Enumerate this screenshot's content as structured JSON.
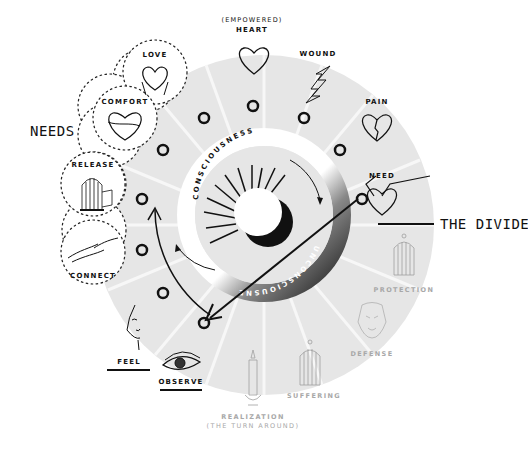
{
  "diagram": {
    "needs_label": "NEEDS",
    "divide_label": "THE DIVIDE",
    "ring": {
      "upper": "CONSCIOUSNESS",
      "lower": "UNCONSCIOUSNESS"
    },
    "needs_circles": [
      {
        "label": "LOVE",
        "icon": "hands-holding-heart-icon"
      },
      {
        "label": "COMFORT",
        "icon": "hug-heart-icon"
      },
      {
        "label": "RELEASE",
        "icon": "open-birdcage-icon"
      },
      {
        "label": "CONNECT",
        "icon": "touching-hands-icon"
      }
    ],
    "stages": [
      {
        "label": "HEART",
        "sublabel": "(EMPOWERED)",
        "icon": "heart-icon"
      },
      {
        "label": "WOUND",
        "icon": "lightning-bolt-icon"
      },
      {
        "label": "PAIN",
        "icon": "broken-heart-icon"
      },
      {
        "label": "NEED",
        "icon": "heart-with-arms-icon"
      },
      {
        "label": "PROTECTION",
        "icon": "closed-birdcage-icon",
        "faded": true
      },
      {
        "label": "DEFENSE",
        "icon": "tiger-icon",
        "faded": true
      },
      {
        "label": "SUFFERING",
        "icon": "caged-bird-icon",
        "faded": true
      },
      {
        "label": "REALIZATION",
        "sublabel": "(THE TURN AROUND)",
        "icon": "candle-icon",
        "faded": true
      },
      {
        "label": "OBSERVE",
        "icon": "eye-icon"
      },
      {
        "label": "FEEL",
        "icon": "face-icon"
      }
    ],
    "colors": {
      "ink": "#111111",
      "disc": "#e6e6e6",
      "faded": "#a8a8a8",
      "ring_dark": "#2a2a2a"
    }
  }
}
